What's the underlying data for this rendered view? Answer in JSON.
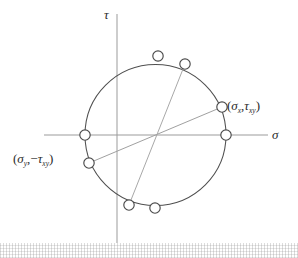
{
  "figure": {
    "kind": "mohrs-circle-diagram",
    "title": "",
    "background_color": "#ffffff",
    "ink_color": "#3a3a3a",
    "axis_color": "#8f8f8f",
    "chord_color": "#9a9a9a",
    "marker_fill": "#ffffff",
    "marker_stroke": "#4a4a4a"
  },
  "axes": {
    "vertical": {
      "name": "tau-axis",
      "label": "τ",
      "x": 117,
      "y_top": 14,
      "y_bottom": 243
    },
    "horizontal": {
      "name": "sigma-axis",
      "label": "σ",
      "y": 135,
      "x_left": 44,
      "x_right": 268
    }
  },
  "circle": {
    "name": "mohr-circle",
    "cx": 155.5,
    "cy": 135,
    "r": 70.5
  },
  "chords": [
    {
      "name": "chord-sigma-x-sigma-y",
      "x1": 222,
      "y1": 107,
      "x2": 89,
      "y2": 163
    },
    {
      "name": "chord-principal-diameter",
      "x1": 185,
      "y1": 64,
      "x2": 129,
      "y2": 205
    }
  ],
  "markers": [
    {
      "name": "marker-sigma-x-tau-xy",
      "cx": 222,
      "cy": 107,
      "r": 5.2
    },
    {
      "name": "marker-sigma-y-neg-tau-xy",
      "cx": 89,
      "cy": 163,
      "r": 5.2
    },
    {
      "name": "marker-sigma-1",
      "cx": 226,
      "cy": 135,
      "r": 5.2
    },
    {
      "name": "marker-sigma-2",
      "cx": 85,
      "cy": 135,
      "r": 5.2
    },
    {
      "name": "marker-top-right",
      "cx": 185,
      "cy": 64,
      "r": 5.2
    },
    {
      "name": "marker-top-left",
      "cx": 158,
      "cy": 56,
      "r": 5.2
    },
    {
      "name": "marker-bottom-left",
      "cx": 129,
      "cy": 205,
      "r": 5.2
    },
    {
      "name": "marker-bottom-right",
      "cx": 155,
      "cy": 208,
      "r": 5.2
    }
  ],
  "labels": {
    "tau_axis": "τ",
    "sigma_axis": "σ",
    "point_x": {
      "open_paren": "(",
      "sigma": "σ",
      "sigma_sub": "x",
      "comma": ",",
      "tau": "τ",
      "tau_sub": "xy",
      "close_paren": ")",
      "full": "(σx,τxy)"
    },
    "point_y": {
      "open_paren": "(",
      "sigma": "σ",
      "sigma_sub": "y",
      "comma": ",",
      "minus": "−",
      "tau": "τ",
      "tau_sub": "xy",
      "close_paren": ")",
      "full": "(σy,−τxy)"
    }
  }
}
